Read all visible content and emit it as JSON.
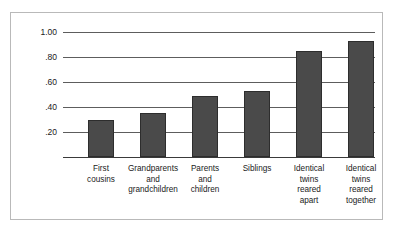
{
  "chart_data": {
    "type": "bar",
    "title": "",
    "xlabel": "",
    "ylabel": "Correlation in I.Q.",
    "ylim": [
      0.0,
      1.0
    ],
    "ytick_labels": [
      "1.00",
      ".80",
      ".60",
      ".40",
      ".20"
    ],
    "ytick_values": [
      1.0,
      0.8,
      0.6,
      0.4,
      0.2
    ],
    "grid": "horizontal",
    "legend": "none",
    "categories": [
      "First cousins",
      "Grandparents and grandchildren",
      "Parents and children",
      "Siblings",
      "Identical twins reared apart",
      "Identical twins reared together"
    ],
    "category_lines": [
      [
        "First",
        "cousins"
      ],
      [
        "Grandparents",
        "and",
        "grandchildren"
      ],
      [
        "Parents",
        "and",
        "children"
      ],
      [
        "Siblings"
      ],
      [
        "Identical",
        "twins",
        "reared",
        "apart"
      ],
      [
        "Identical",
        "twins",
        "reared",
        "together"
      ]
    ],
    "values": [
      0.3,
      0.35,
      0.49,
      0.53,
      0.85,
      0.93
    ],
    "bar_color": "#4a4a4a",
    "bar_edge_color": "#2d2d2d",
    "grid_color": "#5d5d5d",
    "frame_color": "#b9b9b9",
    "background_color": "#ffffff"
  }
}
